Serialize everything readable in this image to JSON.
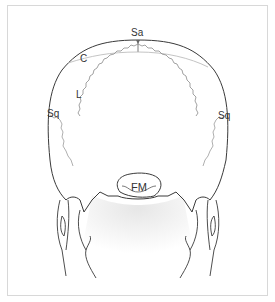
{
  "figure": {
    "labels": {
      "sagittal": "Sa",
      "coronal": "C",
      "lambdoid": "L",
      "squamous_left": "Sq",
      "squamous_right": "Sq",
      "foramen_magnum": "FM"
    },
    "colors": {
      "outline": "#3a3a3a",
      "suture_dark": "#7a7a7a",
      "suture_light": "#b0b0b0",
      "frame": "#d8d8d8",
      "shading": "#ececec"
    }
  }
}
